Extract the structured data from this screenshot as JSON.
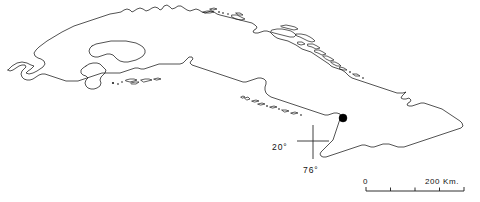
{
  "figure": {
    "type": "outline-map",
    "background_color": "#ffffff",
    "line_color": "#1a1a1a"
  },
  "graticule": {
    "latitude_label": "20°",
    "longitude_label": "76°",
    "crosshair_center_x": 313,
    "crosshair_center_y": 141
  },
  "locality_marker": {
    "symbol": "filled-circle",
    "color": "#000000",
    "x": 343,
    "y": 118
  },
  "scalebar": {
    "min_label": "0",
    "max_label": "200 Km.",
    "ticks": 5,
    "segments": 4,
    "left_x": 366,
    "right_x": 464,
    "baseline_y": 191
  }
}
